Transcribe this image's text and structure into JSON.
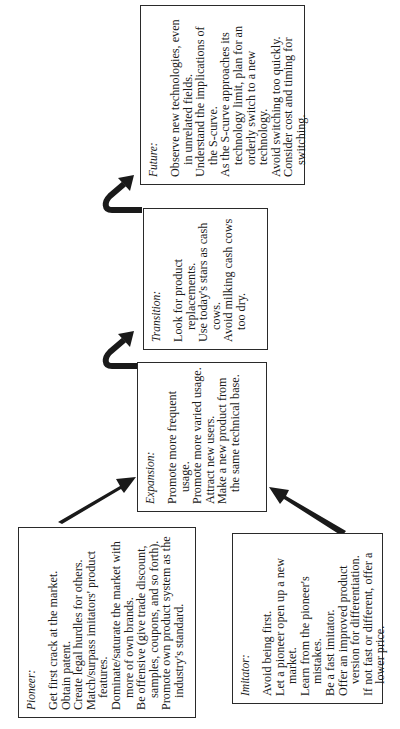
{
  "diagram": {
    "orientation": "rotated-90-ccw",
    "boxes": {
      "pioneer": {
        "title": "Pioneer:",
        "items": [
          "Get first crack at the market.",
          "Obtain patent.",
          "Create legal hurdles for others.",
          "Match/surpass imitators' product features.",
          "Dominate/saturate the market with more of own brands.",
          "Be offensive (give trade discount, samples, coupons, and so forth).",
          "Promote own product system as the industry's standard."
        ]
      },
      "imitator": {
        "title": "Imitator:",
        "items": [
          "Avoid being first.",
          "Let a pioneer open up a new market.",
          "Learn from the pioneer's mistakes.",
          "Be a fast imitator.",
          "Offer an improved product version for differentiation.",
          "If not fast or different, offer a lower price."
        ]
      },
      "expansion": {
        "title": "Expansion:",
        "items": [
          "Promote more frequent usage.",
          "Promote more varied usage.",
          "Attract new users.",
          "Make a new product from the same technical base."
        ]
      },
      "transition": {
        "title": "Transition:",
        "items": [
          "Look for product replacements.",
          "Use today's stars as cash cows.",
          "Avoid milking cash cows too dry."
        ]
      },
      "future": {
        "title": "Future:",
        "items": [
          "Observe new technologies, even in unrelated fields.",
          "Understand the implications of the S-curve.",
          "As the S-curve approaches its technology limit, plan for an orderly switch to a new technology.",
          "Avoid switching too quickly.",
          "Consider cost and timing for switching."
        ]
      }
    },
    "edges": [
      {
        "from": "pioneer",
        "to": "expansion"
      },
      {
        "from": "imitator",
        "to": "expansion"
      },
      {
        "from": "expansion",
        "to": "transition"
      },
      {
        "from": "transition",
        "to": "future"
      }
    ],
    "colors": {
      "line": "#1a1a1a",
      "background": "#ffffff"
    }
  }
}
